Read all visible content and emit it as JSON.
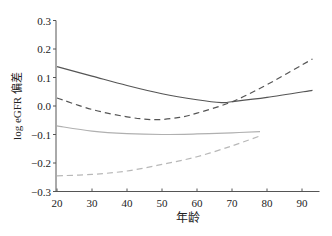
{
  "chart_data": {
    "type": "line",
    "title": "",
    "xlabel": "年龄",
    "ylabel": "log eGFR 偏差",
    "xlim": [
      20,
      95
    ],
    "ylim": [
      -0.3,
      0.3
    ],
    "xticks": [
      20,
      30,
      40,
      50,
      60,
      70,
      80,
      90
    ],
    "yticks": [
      0.3,
      0.2,
      0.1,
      0.0,
      -0.1,
      -0.2,
      -0.3
    ],
    "ytick_labels": [
      "0.3",
      "0.2",
      "0.1",
      "0.0",
      "−0.1",
      "−0.2",
      "−0.3"
    ],
    "grid": false,
    "legend": null,
    "series": [
      {
        "name": "dark-solid",
        "style": "solid",
        "color": "#555555",
        "x": [
          20,
          30,
          40,
          50,
          60,
          67,
          70,
          80,
          93
        ],
        "y": [
          0.138,
          0.105,
          0.072,
          0.043,
          0.022,
          0.012,
          0.015,
          0.03,
          0.055
        ]
      },
      {
        "name": "dark-dashed",
        "style": "dashed",
        "color": "#555555",
        "x": [
          20,
          30,
          40,
          48,
          55,
          60,
          70,
          80,
          93
        ],
        "y": [
          0.028,
          -0.012,
          -0.038,
          -0.048,
          -0.04,
          -0.025,
          0.015,
          0.075,
          0.165
        ]
      },
      {
        "name": "light-solid",
        "style": "solid",
        "color": "#b0b0b0",
        "x": [
          20,
          30,
          40,
          50,
          60,
          70,
          78
        ],
        "y": [
          -0.07,
          -0.088,
          -0.097,
          -0.1,
          -0.098,
          -0.094,
          -0.09
        ]
      },
      {
        "name": "light-dashed",
        "style": "dashed",
        "color": "#b8b8b8",
        "x": [
          20,
          30,
          40,
          50,
          60,
          70,
          78
        ],
        "y": [
          -0.245,
          -0.24,
          -0.228,
          -0.205,
          -0.178,
          -0.14,
          -0.105
        ]
      }
    ]
  }
}
